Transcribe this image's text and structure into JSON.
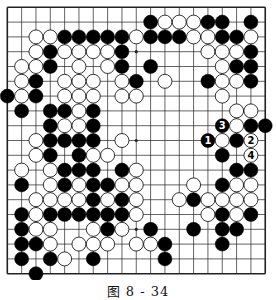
{
  "diagram": {
    "type": "go-board",
    "size": 19,
    "caption": "图 8 - 34",
    "colors": {
      "board": "#ffffff",
      "line": "#222222",
      "black": "#000000",
      "white": "#ffffff"
    },
    "geometry": {
      "x0": 7.3,
      "y0": 7.3,
      "dx": 14.33,
      "dy": 14.8,
      "stone_r": 7.0
    },
    "star_points": [
      [
        3,
        3
      ],
      [
        9,
        3
      ],
      [
        15,
        3
      ],
      [
        3,
        9
      ],
      [
        9,
        9
      ],
      [
        15,
        9
      ],
      [
        3,
        15
      ],
      [
        9,
        15
      ],
      [
        15,
        15
      ]
    ],
    "stones": [
      {
        "c": 10,
        "r": 1,
        "k": "B"
      },
      {
        "c": 11,
        "r": 1,
        "k": "W"
      },
      {
        "c": 12,
        "r": 1,
        "k": "W"
      },
      {
        "c": 13,
        "r": 1,
        "k": "W"
      },
      {
        "c": 14,
        "r": 1,
        "k": "B"
      },
      {
        "c": 15,
        "r": 1,
        "k": "B"
      },
      {
        "c": 17,
        "r": 1,
        "k": "B"
      },
      {
        "c": 2,
        "r": 2,
        "k": "W"
      },
      {
        "c": 3,
        "r": 2,
        "k": "W"
      },
      {
        "c": 4,
        "r": 2,
        "k": "B"
      },
      {
        "c": 5,
        "r": 2,
        "k": "B"
      },
      {
        "c": 6,
        "r": 2,
        "k": "B"
      },
      {
        "c": 7,
        "r": 2,
        "k": "B"
      },
      {
        "c": 8,
        "r": 2,
        "k": "B"
      },
      {
        "c": 9,
        "r": 2,
        "k": "W"
      },
      {
        "c": 10,
        "r": 2,
        "k": "B"
      },
      {
        "c": 11,
        "r": 2,
        "k": "B"
      },
      {
        "c": 12,
        "r": 2,
        "k": "B"
      },
      {
        "c": 13,
        "r": 2,
        "k": "W"
      },
      {
        "c": 14,
        "r": 2,
        "k": "W"
      },
      {
        "c": 15,
        "r": 2,
        "k": "B"
      },
      {
        "c": 16,
        "r": 2,
        "k": "B"
      },
      {
        "c": 17,
        "r": 2,
        "k": "W"
      },
      {
        "c": 2,
        "r": 3,
        "k": "W"
      },
      {
        "c": 3,
        "r": 3,
        "k": "B"
      },
      {
        "c": 4,
        "r": 3,
        "k": "W"
      },
      {
        "c": 5,
        "r": 3,
        "k": "W"
      },
      {
        "c": 6,
        "r": 3,
        "k": "W"
      },
      {
        "c": 7,
        "r": 3,
        "k": "W"
      },
      {
        "c": 8,
        "r": 3,
        "k": "B"
      },
      {
        "c": 14,
        "r": 3,
        "k": "W"
      },
      {
        "c": 15,
        "r": 3,
        "k": "W"
      },
      {
        "c": 16,
        "r": 3,
        "k": "W"
      },
      {
        "c": 17,
        "r": 3,
        "k": "B"
      },
      {
        "c": 1,
        "r": 4,
        "k": "W"
      },
      {
        "c": 2,
        "r": 4,
        "k": "W"
      },
      {
        "c": 3,
        "r": 4,
        "k": "B"
      },
      {
        "c": 5,
        "r": 4,
        "k": "W"
      },
      {
        "c": 7,
        "r": 4,
        "k": "W"
      },
      {
        "c": 8,
        "r": 4,
        "k": "B"
      },
      {
        "c": 10,
        "r": 4,
        "k": "B"
      },
      {
        "c": 15,
        "r": 4,
        "k": "W"
      },
      {
        "c": 16,
        "r": 4,
        "k": "B"
      },
      {
        "c": 17,
        "r": 4,
        "k": "B"
      },
      {
        "c": 1,
        "r": 5,
        "k": "W"
      },
      {
        "c": 2,
        "r": 5,
        "k": "B"
      },
      {
        "c": 4,
        "r": 5,
        "k": "W"
      },
      {
        "c": 5,
        "r": 5,
        "k": "W"
      },
      {
        "c": 6,
        "r": 5,
        "k": "W"
      },
      {
        "c": 8,
        "r": 5,
        "k": "W"
      },
      {
        "c": 9,
        "r": 5,
        "k": "B"
      },
      {
        "c": 11,
        "r": 5,
        "k": "W"
      },
      {
        "c": 14,
        "r": 5,
        "k": "B"
      },
      {
        "c": 15,
        "r": 5,
        "k": "W"
      },
      {
        "c": 16,
        "r": 5,
        "k": "W"
      },
      {
        "c": 17,
        "r": 5,
        "k": "B"
      },
      {
        "c": 0,
        "r": 6,
        "k": "B"
      },
      {
        "c": 1,
        "r": 6,
        "k": "W"
      },
      {
        "c": 2,
        "r": 6,
        "k": "B"
      },
      {
        "c": 4,
        "r": 6,
        "k": "W"
      },
      {
        "c": 5,
        "r": 6,
        "k": "W"
      },
      {
        "c": 6,
        "r": 6,
        "k": "W"
      },
      {
        "c": 8,
        "r": 6,
        "k": "W"
      },
      {
        "c": 9,
        "r": 6,
        "k": "W"
      },
      {
        "c": 15,
        "r": 6,
        "k": "W"
      },
      {
        "c": 1,
        "r": 7,
        "k": "B"
      },
      {
        "c": 3,
        "r": 7,
        "k": "B"
      },
      {
        "c": 4,
        "r": 7,
        "k": "B"
      },
      {
        "c": 5,
        "r": 7,
        "k": "W"
      },
      {
        "c": 6,
        "r": 7,
        "k": "B"
      },
      {
        "c": 16,
        "r": 7,
        "k": "W"
      },
      {
        "c": 17,
        "r": 7,
        "k": "W"
      },
      {
        "c": 3,
        "r": 8,
        "k": "B"
      },
      {
        "c": 4,
        "r": 8,
        "k": "W"
      },
      {
        "c": 5,
        "r": 8,
        "k": "W"
      },
      {
        "c": 6,
        "r": 8,
        "k": "B"
      },
      {
        "c": 15,
        "r": 8,
        "k": "B",
        "label": "3"
      },
      {
        "c": 16,
        "r": 8,
        "k": "W"
      },
      {
        "c": 17,
        "r": 8,
        "k": "B"
      },
      {
        "c": 18,
        "r": 8,
        "k": "B"
      },
      {
        "c": 2,
        "r": 9,
        "k": "W"
      },
      {
        "c": 3,
        "r": 9,
        "k": "B"
      },
      {
        "c": 4,
        "r": 9,
        "k": "B"
      },
      {
        "c": 5,
        "r": 9,
        "k": "B"
      },
      {
        "c": 6,
        "r": 9,
        "k": "B"
      },
      {
        "c": 8,
        "r": 9,
        "k": "W"
      },
      {
        "c": 14,
        "r": 9,
        "k": "B",
        "label": "1"
      },
      {
        "c": 15,
        "r": 9,
        "k": "W"
      },
      {
        "c": 16,
        "r": 9,
        "k": "B"
      },
      {
        "c": 17,
        "r": 9,
        "k": "W",
        "label": "2"
      },
      {
        "c": 2,
        "r": 10,
        "k": "W"
      },
      {
        "c": 3,
        "r": 10,
        "k": "B"
      },
      {
        "c": 5,
        "r": 10,
        "k": "B"
      },
      {
        "c": 6,
        "r": 10,
        "k": "W"
      },
      {
        "c": 7,
        "r": 10,
        "k": "W"
      },
      {
        "c": 15,
        "r": 10,
        "k": "B"
      },
      {
        "c": 17,
        "r": 10,
        "k": "W",
        "label": "4"
      },
      {
        "c": 1,
        "r": 11,
        "k": "W"
      },
      {
        "c": 3,
        "r": 11,
        "k": "W"
      },
      {
        "c": 4,
        "r": 11,
        "k": "B"
      },
      {
        "c": 5,
        "r": 11,
        "k": "B"
      },
      {
        "c": 6,
        "r": 11,
        "k": "B"
      },
      {
        "c": 8,
        "r": 11,
        "k": "B"
      },
      {
        "c": 9,
        "r": 11,
        "k": "W"
      },
      {
        "c": 16,
        "r": 11,
        "k": "B"
      },
      {
        "c": 17,
        "r": 11,
        "k": "B"
      },
      {
        "c": 1,
        "r": 12,
        "k": "B"
      },
      {
        "c": 3,
        "r": 12,
        "k": "W"
      },
      {
        "c": 4,
        "r": 12,
        "k": "B"
      },
      {
        "c": 5,
        "r": 12,
        "k": "W"
      },
      {
        "c": 6,
        "r": 12,
        "k": "B"
      },
      {
        "c": 7,
        "r": 12,
        "k": "B"
      },
      {
        "c": 8,
        "r": 12,
        "k": "W"
      },
      {
        "c": 9,
        "r": 12,
        "k": "W"
      },
      {
        "c": 13,
        "r": 12,
        "k": "W"
      },
      {
        "c": 15,
        "r": 12,
        "k": "B"
      },
      {
        "c": 16,
        "r": 12,
        "k": "W"
      },
      {
        "c": 17,
        "r": 12,
        "k": "W"
      },
      {
        "c": 2,
        "r": 13,
        "k": "W"
      },
      {
        "c": 3,
        "r": 13,
        "k": "W"
      },
      {
        "c": 4,
        "r": 13,
        "k": "W"
      },
      {
        "c": 5,
        "r": 13,
        "k": "W"
      },
      {
        "c": 6,
        "r": 13,
        "k": "B"
      },
      {
        "c": 7,
        "r": 13,
        "k": "W"
      },
      {
        "c": 8,
        "r": 13,
        "k": "B"
      },
      {
        "c": 9,
        "r": 13,
        "k": "W"
      },
      {
        "c": 12,
        "r": 13,
        "k": "W"
      },
      {
        "c": 13,
        "r": 13,
        "k": "B"
      },
      {
        "c": 14,
        "r": 13,
        "k": "W"
      },
      {
        "c": 15,
        "r": 13,
        "k": "W"
      },
      {
        "c": 16,
        "r": 13,
        "k": "W"
      },
      {
        "c": 17,
        "r": 13,
        "k": "W"
      },
      {
        "c": 1,
        "r": 14,
        "k": "B"
      },
      {
        "c": 2,
        "r": 14,
        "k": "W"
      },
      {
        "c": 3,
        "r": 14,
        "k": "B"
      },
      {
        "c": 4,
        "r": 14,
        "k": "B"
      },
      {
        "c": 5,
        "r": 14,
        "k": "B"
      },
      {
        "c": 6,
        "r": 14,
        "k": "B"
      },
      {
        "c": 7,
        "r": 14,
        "k": "B"
      },
      {
        "c": 8,
        "r": 14,
        "k": "B"
      },
      {
        "c": 9,
        "r": 14,
        "k": "W"
      },
      {
        "c": 14,
        "r": 14,
        "k": "W"
      },
      {
        "c": 15,
        "r": 14,
        "k": "B"
      },
      {
        "c": 16,
        "r": 14,
        "k": "W"
      },
      {
        "c": 17,
        "r": 14,
        "k": "B"
      },
      {
        "c": 1,
        "r": 15,
        "k": "B"
      },
      {
        "c": 2,
        "r": 15,
        "k": "W"
      },
      {
        "c": 3,
        "r": 15,
        "k": "W"
      },
      {
        "c": 6,
        "r": 15,
        "k": "W"
      },
      {
        "c": 7,
        "r": 15,
        "k": "B"
      },
      {
        "c": 8,
        "r": 15,
        "k": "W"
      },
      {
        "c": 10,
        "r": 15,
        "k": "B"
      },
      {
        "c": 13,
        "r": 15,
        "k": "B"
      },
      {
        "c": 15,
        "r": 15,
        "k": "B"
      },
      {
        "c": 16,
        "r": 15,
        "k": "B"
      },
      {
        "c": 1,
        "r": 16,
        "k": "B"
      },
      {
        "c": 2,
        "r": 16,
        "k": "B"
      },
      {
        "c": 3,
        "r": 16,
        "k": "W"
      },
      {
        "c": 5,
        "r": 16,
        "k": "W"
      },
      {
        "c": 6,
        "r": 16,
        "k": "W"
      },
      {
        "c": 7,
        "r": 16,
        "k": "W"
      },
      {
        "c": 9,
        "r": 16,
        "k": "W"
      },
      {
        "c": 10,
        "r": 16,
        "k": "W"
      },
      {
        "c": 11,
        "r": 16,
        "k": "B"
      },
      {
        "c": 15,
        "r": 16,
        "k": "B"
      },
      {
        "c": 1,
        "r": 17,
        "k": "B"
      },
      {
        "c": 3,
        "r": 17,
        "k": "B"
      },
      {
        "c": 4,
        "r": 17,
        "k": "W"
      },
      {
        "c": 6,
        "r": 17,
        "k": "B"
      },
      {
        "c": 11,
        "r": 17,
        "k": "B"
      },
      {
        "c": 2,
        "r": 18,
        "k": "B"
      }
    ]
  }
}
